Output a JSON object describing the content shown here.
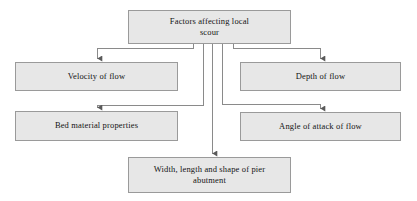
{
  "diagram": {
    "title": "Factors affecting local scour",
    "type": "flowchart",
    "orientation": "top-down",
    "colors": {
      "node_fill": "#e7e7e7",
      "node_border": "#9a9a9a",
      "edge_stroke": "#8a8a8a",
      "text": "#141414",
      "background": "#ffffff"
    },
    "nodes": {
      "root": {
        "label": "Factors affecting local\nscour"
      },
      "velocity": {
        "label": "Velocity of flow"
      },
      "bed": {
        "label": "Bed material properties"
      },
      "depth": {
        "label": "Depth of flow"
      },
      "angle": {
        "label": "Angle of attack of flow"
      },
      "width": {
        "label": "Width, length and shape of pier\nabutment"
      }
    },
    "edges": [
      {
        "from": "root",
        "to": "velocity"
      },
      {
        "from": "root",
        "to": "bed"
      },
      {
        "from": "root",
        "to": "depth"
      },
      {
        "from": "root",
        "to": "angle"
      },
      {
        "from": "root",
        "to": "width"
      }
    ]
  }
}
